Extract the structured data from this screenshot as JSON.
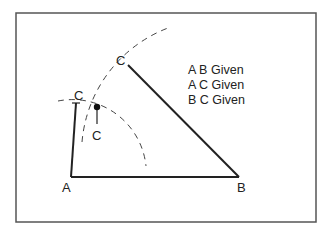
{
  "diagram": {
    "points": {
      "A": "A",
      "B": "B",
      "C_from_B": "C",
      "C_from_A": "C",
      "C_intersection": "C"
    },
    "given": [
      "A B Given",
      "A C Given",
      "B C Given"
    ],
    "colors": {
      "line": "#222222",
      "frame": "#555555",
      "dashed": "#444444",
      "background": "#ffffff"
    }
  }
}
